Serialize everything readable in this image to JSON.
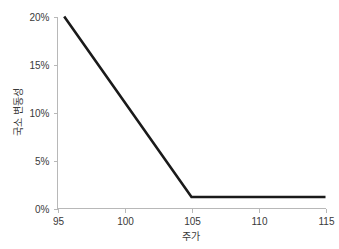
{
  "chart_data": {
    "type": "line",
    "title": "",
    "xlabel": "주가",
    "ylabel": "국소 변동성",
    "xlim": [
      95,
      115
    ],
    "ylim": [
      0,
      20
    ],
    "xticks": [
      95,
      100,
      105,
      110,
      115
    ],
    "xtick_labels": [
      "95",
      "100",
      "105",
      "110",
      "115"
    ],
    "yticks": [
      0,
      5,
      10,
      15,
      20
    ],
    "ytick_labels": [
      "0%",
      "5%",
      "10%",
      "15%",
      "20%"
    ],
    "grid": false,
    "legend": false,
    "series": [
      {
        "name": "국소 변동성",
        "color": "#1a1a1a",
        "x": [
          95.5,
          105.0,
          115.0
        ],
        "y": [
          20.0,
          1.2,
          1.2
        ]
      }
    ],
    "annotations": []
  },
  "axis_style": {
    "axis_color": "#b8b8b8",
    "tick_color": "#b8b8b8",
    "label_color": "#3a3a3a",
    "background": "#ffffff"
  }
}
